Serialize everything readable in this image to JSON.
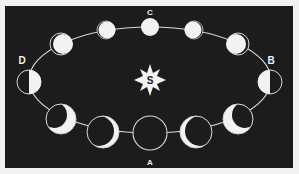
{
  "diagram": {
    "colors": {
      "background": "#1c1c1c",
      "border": "#f2f2f0",
      "lit": "#f2f2f0",
      "orbit": "#d8d8d8"
    },
    "sun": {
      "label": "S",
      "icon": "star-sun-icon"
    },
    "position_labels": {
      "A": "A",
      "B": "B",
      "C": "C",
      "D": "D"
    },
    "moons": [
      {
        "id": "A",
        "phase": "new",
        "position": "bottom"
      },
      {
        "id": "waxing-crescent-thin",
        "phase": "waxing crescent",
        "position": "bottom-right-1"
      },
      {
        "id": "waxing-crescent",
        "phase": "waxing crescent",
        "position": "bottom-right-2"
      },
      {
        "id": "B",
        "phase": "first quarter",
        "position": "right"
      },
      {
        "id": "waxing-gibbous-1",
        "phase": "waxing gibbous",
        "position": "top-right-2"
      },
      {
        "id": "waxing-gibbous-2",
        "phase": "waxing gibbous",
        "position": "top-right-1"
      },
      {
        "id": "C",
        "phase": "full",
        "position": "top"
      },
      {
        "id": "waning-gibbous-1",
        "phase": "waning gibbous",
        "position": "top-left-1"
      },
      {
        "id": "waning-gibbous-2",
        "phase": "waning gibbous",
        "position": "top-left-2"
      },
      {
        "id": "D",
        "phase": "last quarter",
        "position": "left"
      },
      {
        "id": "waning-crescent",
        "phase": "waning crescent",
        "position": "bottom-left-2"
      },
      {
        "id": "waning-crescent-thin",
        "phase": "waning crescent",
        "position": "bottom-left-1"
      }
    ]
  }
}
